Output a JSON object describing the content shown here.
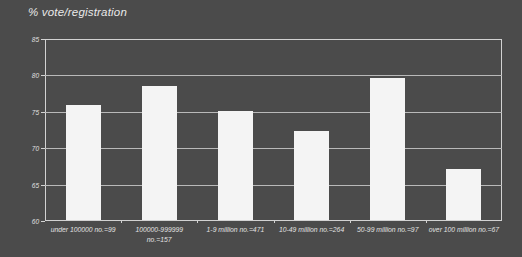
{
  "chart_data": {
    "type": "bar",
    "title": "% vote/registration",
    "xlabel": "",
    "ylabel": "",
    "ylim": [
      60,
      85
    ],
    "yticks": [
      60,
      65,
      70,
      75,
      80,
      85
    ],
    "ytick_labels": [
      "60",
      "65",
      "70",
      "75",
      "80",
      "85"
    ],
    "grid": true,
    "legend": false,
    "categories": [
      "under 100000 no.=99",
      "100000-999999\nno.=157",
      "1-9 million no.=471",
      "10-49 million no.=264",
      "50-99 million no.=97",
      "over 100 million no.=67"
    ],
    "values": [
      75.9,
      78.6,
      75.1,
      72.3,
      79.7,
      67.1
    ],
    "bar_color": "#f4f4f4",
    "background_color": "#4b4b4b",
    "axis_color": "#d2d2d2",
    "gridline_color": "#b9b9b9",
    "text_color": "#e6e6e6"
  }
}
